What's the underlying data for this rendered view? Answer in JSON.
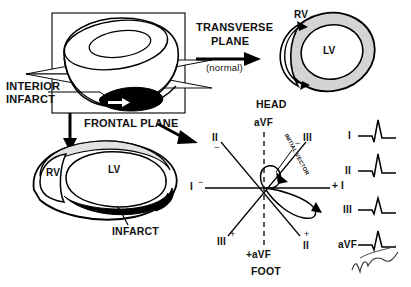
{
  "figure": {
    "title_labels": {
      "interior_infarct_line1": "INTERIOR",
      "interior_infarct_line2": "INFARCT",
      "transverse_plane_line1": "TRANSVERSE",
      "transverse_plane_line2": "PLANE",
      "normal_note": "(normal)",
      "frontal_plane": "FRONTAL PLANE",
      "head": "HEAD",
      "foot": "FOOT",
      "infarct": "INFARCT",
      "initial_vector": "INITIAL VECTOR"
    },
    "transverse_section": {
      "rv_label": "RV",
      "lv_label": "LV",
      "ring_fill": "#d4d4d4",
      "outline": "#000000"
    },
    "frontal_section": {
      "rv_label": "RV",
      "lv_label": "LV",
      "infarct_fill": "#000000",
      "wall_fill": "#e2e2e2"
    },
    "hexaxial": {
      "axes": [
        {
          "name": "lead-I",
          "neg_label": "I",
          "neg_sign": "−",
          "pos_label": "I",
          "pos_sign": "+",
          "angle_deg": 0
        },
        {
          "name": "lead-II",
          "neg_label": "II",
          "neg_sign": "−",
          "pos_label": "II",
          "pos_sign": "+",
          "angle_deg": 60
        },
        {
          "name": "lead-III",
          "neg_label": "III",
          "neg_sign": "−",
          "pos_label": "III",
          "pos_sign": "+",
          "angle_deg": 120
        },
        {
          "name": "lead-aVF",
          "neg_label": "aVF",
          "neg_sign": "−",
          "pos_label": "+aVF",
          "pos_sign": "+",
          "angle_deg": 90
        }
      ],
      "neg_I": "I",
      "pos_I": "+ I",
      "neg_II": "II",
      "pos_II": "II",
      "neg_III": "III",
      "pos_III": "III",
      "neg_aVF": "aVF",
      "pos_aVF": "+aVF",
      "minus": "−",
      "plus": "+"
    },
    "ecg_traces": [
      {
        "lead": "I",
        "morphology": "small-q-tall-R"
      },
      {
        "lead": "II",
        "morphology": "small-q-tall-R"
      },
      {
        "lead": "III",
        "morphology": "q-small-R"
      },
      {
        "lead": "aVF",
        "morphology": "q-small-R"
      }
    ],
    "signature": "handwritten-signature",
    "colors": {
      "ink": "#000000",
      "gray_fill": "#d4d4d4",
      "light_fill": "#efefef",
      "paper": "#ffffff"
    }
  }
}
